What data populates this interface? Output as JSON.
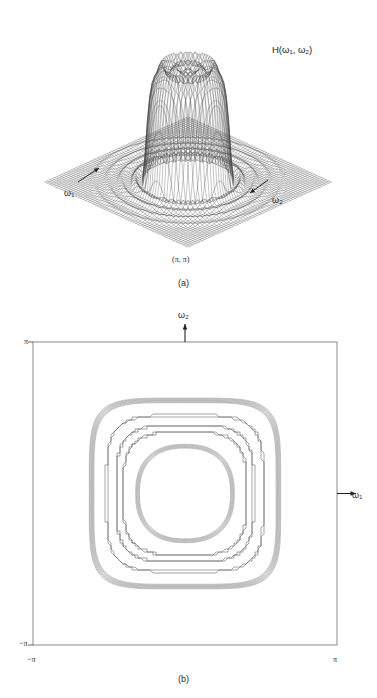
{
  "figure": {
    "kind": "two-panel-figure",
    "panel_a": {
      "caption": "(a)",
      "surface_label": "H(ω₁, ω₂)",
      "axis_label_1": "ω₁",
      "axis_label_2": "ω₂",
      "corner_label": "(π, π)",
      "line_color": "#3c3c3c",
      "plane_color": "#6a6a6a"
    },
    "panel_b": {
      "caption": "(b)",
      "axis_label_x": "ω₁",
      "axis_label_y": "ω₂",
      "tick_top_left": "π",
      "tick_bottom_left": "−π",
      "tick_bottom_left_x": "−π",
      "tick_bottom_right": "π",
      "frame_color": "#8a8a8a",
      "contour_color": "#555555"
    }
  },
  "chart_data": [
    {
      "type": "surface",
      "panel": "a",
      "title": "H(ω₁, ω₂)",
      "description": "3-D perspective mesh of the magnitude frequency response of a circularly symmetric two-dimensional lowpass filter over the region -π ≤ ω₁, ω₂ ≤ π",
      "xlabel": "ω₁",
      "ylabel": "ω₂",
      "zlabel": "H(ω₁, ω₂)",
      "xlim": [
        -3.14159,
        3.14159
      ],
      "ylim": [
        -3.14159,
        3.14159
      ],
      "zlim": [
        0,
        1.12
      ],
      "grid": true,
      "legend": "none",
      "annotations": [
        {
          "text": "H(ω₁, ω₂)",
          "x": 290,
          "y": 50
        },
        {
          "text": "ω₁",
          "x": 70,
          "y": 196
        },
        {
          "text": "ω₂",
          "x": 277,
          "y": 203
        },
        {
          "text": "(π, π)",
          "x": 186,
          "y": 262
        }
      ],
      "surface_model": {
        "form": "ideal circular lowpass with Gibbs ripple",
        "passband_radius": 1.25,
        "transition_width": 0.22,
        "passband_value": 1.0,
        "stopband_value": 0.0,
        "ripple_amplitude": 0.09,
        "ripple_frequency": 15,
        "mesh_lines_u": 41,
        "mesh_lines_v": 41
      }
    },
    {
      "type": "contour",
      "panel": "b",
      "title": "",
      "description": "Contour plot of the same circularly symmetric lowpass frequency response; rounded-square quantized level curves concentric about the origin",
      "xlabel": "ω₁",
      "ylabel": "ω₂",
      "xlim": [
        -3.14159,
        3.14159
      ],
      "ylim": [
        -3.14159,
        3.14159
      ],
      "xticks": [
        -3.14159,
        3.14159
      ],
      "yticks": [
        -3.14159,
        3.14159
      ],
      "xticklabels": [
        "−π",
        "π"
      ],
      "yticklabels": [
        "−π",
        "π"
      ],
      "grid": false,
      "legend": "none",
      "center": [
        0,
        0
      ],
      "levels": [
        0.1,
        0.3,
        0.5,
        0.7,
        0.9
      ],
      "level_radii": [
        1.93,
        1.62,
        1.42,
        1.28,
        0.98
      ],
      "contour_squareness": [
        0.3,
        0.22,
        0.18,
        0.14,
        0.04
      ],
      "band_multiplicity": [
        7,
        2,
        2,
        2,
        6
      ]
    }
  ]
}
